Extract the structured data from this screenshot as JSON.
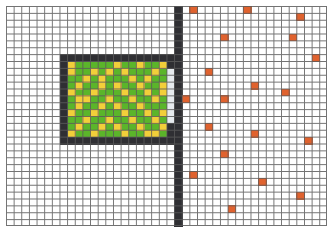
{
  "board": {
    "cols": 42,
    "rows": 32,
    "cell_w": 7.643,
    "cell_h": 6.875,
    "colors": {
      "background": "#ffffff",
      "grid_line": "#5a5a5a",
      "wall": "#2f2f33",
      "nest_floor": "#5bb52a",
      "food_stored": "#f2cf3a",
      "channel": "#e6eaee",
      "food_item": "#e0622e"
    }
  },
  "walls": [
    {
      "name": "vertical-wall",
      "col": 22,
      "row": 0,
      "w": 1,
      "h": 32
    },
    {
      "name": "nest-top-wall",
      "col": 7,
      "row": 7,
      "w": 15,
      "h": 1
    },
    {
      "name": "nest-bottom-wall",
      "col": 7,
      "row": 19,
      "w": 15,
      "h": 1
    },
    {
      "name": "nest-left-wall",
      "col": 7,
      "row": 7,
      "w": 1,
      "h": 13
    },
    {
      "name": "nest-right-wall-top",
      "col": 21,
      "row": 8,
      "w": 1,
      "h": 1
    },
    {
      "name": "nest-right-wall-bottom",
      "col": 21,
      "row": 17,
      "w": 1,
      "h": 2
    }
  ],
  "nest": {
    "col": 8,
    "row": 8,
    "w": 13,
    "h": 11
  },
  "channel": {
    "col": 21,
    "row": 9,
    "w": 1,
    "h": 8
  },
  "stored_food": [
    [
      0,
      1
    ],
    [
      3,
      1
    ],
    [
      5,
      1
    ],
    [
      7,
      1
    ],
    [
      11,
      1
    ],
    [
      2,
      2
    ],
    [
      8,
      2
    ],
    [
      10,
      2
    ],
    [
      1,
      3
    ],
    [
      4,
      3
    ],
    [
      6,
      3
    ],
    [
      9,
      3
    ],
    [
      12,
      3
    ],
    [
      0,
      4
    ],
    [
      3,
      4
    ],
    [
      7,
      4
    ],
    [
      10,
      4
    ],
    [
      12,
      4
    ],
    [
      2,
      5
    ],
    [
      5,
      5
    ],
    [
      8,
      5
    ],
    [
      11,
      5
    ],
    [
      1,
      6
    ],
    [
      4,
      6
    ],
    [
      6,
      6
    ],
    [
      9,
      6
    ],
    [
      0,
      7
    ],
    [
      3,
      7
    ],
    [
      7,
      7
    ],
    [
      10,
      7
    ],
    [
      12,
      7
    ],
    [
      2,
      8
    ],
    [
      5,
      8
    ],
    [
      8,
      8
    ],
    [
      11,
      8
    ],
    [
      1,
      9
    ],
    [
      4,
      9
    ],
    [
      6,
      9
    ],
    [
      9,
      9
    ],
    [
      12,
      9
    ],
    [
      0,
      10
    ],
    [
      3,
      10
    ],
    [
      7,
      10
    ],
    [
      10,
      10
    ],
    [
      0,
      0
    ],
    [
      6,
      0
    ],
    [
      9,
      0
    ],
    [
      12,
      0
    ],
    [
      4,
      2
    ],
    [
      1,
      5
    ],
    [
      11,
      10
    ]
  ],
  "food_items": [
    [
      24,
      0
    ],
    [
      31,
      0
    ],
    [
      38,
      1
    ],
    [
      28,
      4
    ],
    [
      37,
      4
    ],
    [
      40,
      7
    ],
    [
      26,
      9
    ],
    [
      32,
      11
    ],
    [
      36,
      12
    ],
    [
      23,
      13
    ],
    [
      28,
      13
    ],
    [
      26,
      17
    ],
    [
      32,
      18
    ],
    [
      39,
      19
    ],
    [
      28,
      21
    ],
    [
      24,
      24
    ],
    [
      33,
      25
    ],
    [
      38,
      27
    ],
    [
      29,
      29
    ]
  ]
}
